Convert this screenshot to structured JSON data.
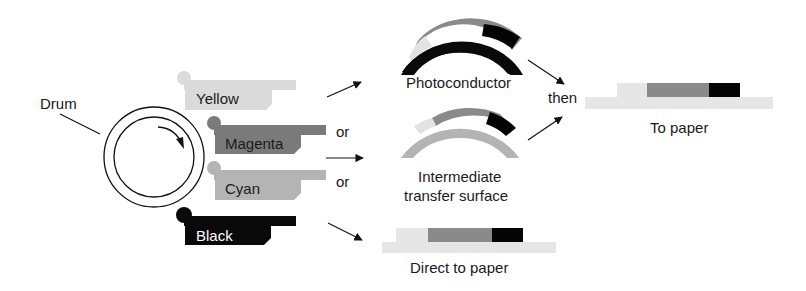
{
  "diagram": {
    "drum": {
      "label": "Drum"
    },
    "toner_units": [
      {
        "id": "yellow",
        "label": "Yellow",
        "color": "#dadada",
        "text_color": "#1a1a1a"
      },
      {
        "id": "magenta",
        "label": "Magenta",
        "color": "#7a7a7a",
        "text_color": "#1a1a1a"
      },
      {
        "id": "cyan",
        "label": "Cyan",
        "color": "#b4b4b4",
        "text_color": "#1a1a1a"
      },
      {
        "id": "black",
        "label": "Black",
        "color": "#0a0a0a",
        "text_color": "#ffffff"
      }
    ],
    "connectors": {
      "or_1": "or",
      "or_2": "or",
      "then": "then"
    },
    "paths": {
      "photoconductor": {
        "label": "Photoconductor",
        "surface_color": "#0a0a0a"
      },
      "intermediate": {
        "label_line1": "Intermediate",
        "label_line2": "transfer surface",
        "surface_color": "#b4b4b4"
      },
      "direct": {
        "label": "Direct to paper"
      },
      "to_paper": {
        "label": "To paper"
      }
    },
    "layer_colors": {
      "yellow": "#e2e2e2",
      "magenta_cyan": "#8a8a8a",
      "black": "#050505",
      "paper": "#e6e6e6"
    }
  }
}
